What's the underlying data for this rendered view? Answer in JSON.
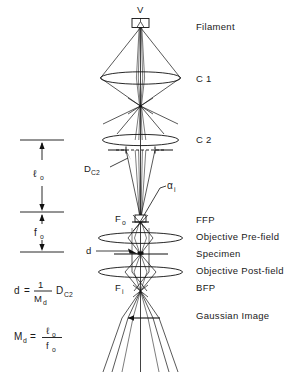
{
  "figure": {
    "background_color": "#ffffff",
    "line_color": "#111111"
  },
  "axis_labels": {
    "source": "V",
    "c2_aperture": "D",
    "c2_aperture_sub": "C2",
    "convergence_angle": "α",
    "convergence_angle_sub": "i",
    "front_focal_point": "F",
    "front_focal_point_sub": "o",
    "back_focal_point": "F",
    "back_focal_point_sub": "i",
    "probe_diameter": "d"
  },
  "right_labels": [
    {
      "text": "Filament",
      "y": 30
    },
    {
      "text": "C 1",
      "y": 82
    },
    {
      "text": "C 2",
      "y": 143
    },
    {
      "text": "FFP",
      "y": 223
    },
    {
      "text": "Objective Pre-field",
      "y": 240
    },
    {
      "text": "Specimen",
      "y": 257
    },
    {
      "text": "Objective Post-field",
      "y": 274
    },
    {
      "text": "BFP",
      "y": 291
    },
    {
      "text": "Gaussian Image",
      "y": 319
    }
  ],
  "scale_bar": {
    "upper_segment_label": "ℓ",
    "upper_segment_sub": "o",
    "lower_segment_label": "f",
    "lower_segment_sub": "o"
  },
  "formulas": {
    "probe_diameter": {
      "lhs": "d",
      "equals": "=",
      "numerator": "1",
      "denominator_base": "M",
      "denominator_sub": "d",
      "factor_base": "D",
      "factor_sub": "C2"
    },
    "demagnification": {
      "lhs_base": "M",
      "lhs_sub": "d",
      "equals": "=",
      "numerator_base": "ℓ",
      "numerator_sub": "o",
      "denominator_base": "f",
      "denominator_sub": "o"
    }
  }
}
